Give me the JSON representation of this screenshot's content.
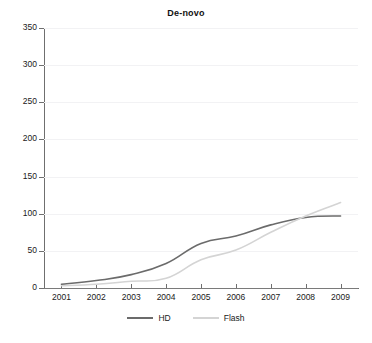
{
  "chart_data": {
    "type": "line",
    "title": "De-novo",
    "xlabel": "",
    "ylabel": "",
    "x": [
      "2001",
      "2002",
      "2003",
      "2004",
      "2005",
      "2006",
      "2007",
      "2008",
      "2009"
    ],
    "categories": [
      "2001",
      "2002",
      "2003",
      "2004",
      "2005",
      "2006",
      "2007",
      "2008",
      "2009"
    ],
    "series": [
      {
        "name": "HD",
        "color": "#6b6b6b",
        "values": [
          5,
          10,
          18,
          33,
          60,
          70,
          85,
          95,
          97
        ]
      },
      {
        "name": "Flash",
        "color": "#d4d4d4",
        "values": [
          3,
          5,
          9,
          13,
          38,
          51,
          75,
          97,
          115
        ]
      }
    ],
    "ylim": [
      0,
      350
    ],
    "ytick_step": 50,
    "yticks": [
      0,
      50,
      100,
      150,
      200,
      250,
      300,
      350
    ],
    "ytick_labels": [
      "0",
      "50",
      "100",
      "150",
      "200",
      "250",
      "300",
      "350"
    ],
    "grid": true,
    "grid_color": "#f2f2f4",
    "legend_position": "bottom",
    "axis_color": "#6f6f6f",
    "background": "#ffffff"
  },
  "legend": {
    "entries": [
      {
        "label": "HD",
        "color": "#6b6b6b"
      },
      {
        "label": "Flash",
        "color": "#d4d4d4"
      }
    ]
  }
}
